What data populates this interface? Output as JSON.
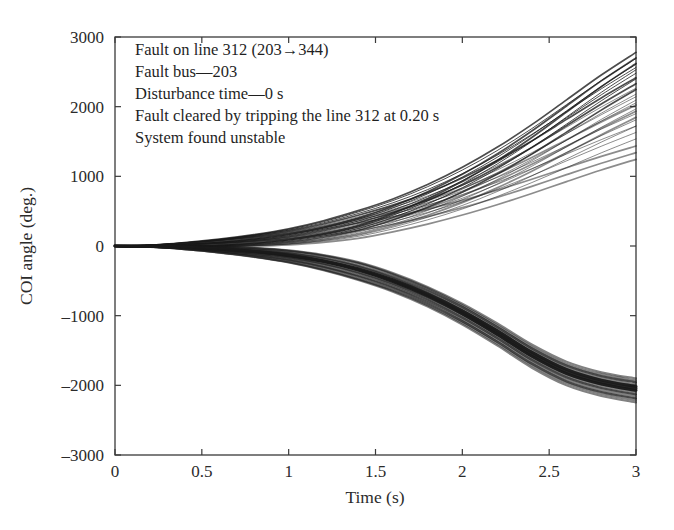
{
  "figure": {
    "background_color": "#ffffff",
    "frame_color": "#3a3a3a",
    "curve_color": "#1a1a1a"
  },
  "annotation": {
    "lines": [
      "Fault on line 312 (203→344)",
      "Fault bus—203",
      "Disturbance time—0 s",
      "Fault cleared by tripping the line 312 at 0.20 s",
      "System found unstable"
    ]
  },
  "axes": {
    "x_title": "Time (s)",
    "y_title": "COI angle (deg.)",
    "x_ticks": [
      "0",
      "0.5",
      "1",
      "1.5",
      "2",
      "2.5",
      "3"
    ],
    "y_ticks": [
      "3000",
      "2000",
      "1000",
      "0",
      "–1000",
      "–2000",
      "–3000"
    ]
  },
  "chart_data": {
    "type": "line",
    "title": "",
    "subtitle": "",
    "xlabel": "Time (s)",
    "ylabel": "COI angle (deg.)",
    "xlim": [
      0,
      3
    ],
    "ylim": [
      -3000,
      3000
    ],
    "xticks": [
      0,
      0.5,
      1,
      1.5,
      2,
      2.5,
      3
    ],
    "yticks": [
      -3000,
      -2000,
      -1000,
      0,
      1000,
      2000,
      3000
    ],
    "grid": false,
    "legend": "none",
    "annotations": [
      "Fault on line 312 (203→344)",
      "Fault bus—203",
      "Disturbance time—0 s",
      "Fault cleared by tripping the line 312 at 0.20 s",
      "System found unstable"
    ],
    "x": [
      0,
      0.2,
      0.4,
      0.6,
      0.8,
      1.0,
      1.2,
      1.4,
      1.6,
      1.8,
      2.0,
      2.2,
      2.4,
      2.6,
      2.8,
      3.0
    ],
    "series": [
      {
        "name": "gen-up-1",
        "values": [
          0,
          8,
          26,
          58,
          105,
          170,
          268,
          400,
          570,
          780,
          1030,
          1320,
          1650,
          2010,
          2370,
          2700
        ]
      },
      {
        "name": "gen-up-2",
        "values": [
          0,
          7,
          24,
          54,
          99,
          161,
          254,
          381,
          546,
          748,
          990,
          1272,
          1592,
          1940,
          2290,
          2610
        ]
      },
      {
        "name": "gen-up-3",
        "values": [
          0,
          7,
          22,
          50,
          92,
          150,
          238,
          358,
          514,
          706,
          936,
          1204,
          1508,
          1840,
          2170,
          2480
        ]
      },
      {
        "name": "gen-up-4",
        "values": [
          0,
          6,
          20,
          46,
          85,
          139,
          221,
          333,
          480,
          660,
          876,
          1128,
          1414,
          1726,
          2038,
          2330
        ]
      },
      {
        "name": "gen-up-5",
        "values": [
          0,
          6,
          19,
          43,
          79,
          129,
          205,
          310,
          446,
          614,
          816,
          1052,
          1320,
          1612,
          1906,
          2180
        ]
      },
      {
        "name": "gen-up-6",
        "values": [
          0,
          6,
          18,
          41,
          75,
          122,
          194,
          292,
          420,
          578,
          768,
          990,
          1242,
          1518,
          1794,
          2055
        ]
      },
      {
        "name": "gen-up-7",
        "values": [
          0,
          5,
          17,
          39,
          71,
          116,
          184,
          277,
          398,
          547,
          726,
          935,
          1172,
          1430,
          1690,
          1935
        ]
      },
      {
        "name": "gen-up-8",
        "values": [
          0,
          5,
          16,
          37,
          68,
          110,
          175,
          263,
          378,
          518,
          686,
          882,
          1104,
          1344,
          1584,
          1810
        ]
      },
      {
        "name": "gen-up-9",
        "values": [
          0,
          5,
          16,
          35,
          64,
          104,
          165,
          247,
          353,
          482,
          635,
          812,
          1010,
          1222,
          1432,
          1630
        ]
      },
      {
        "name": "gen-up-10",
        "values": [
          0,
          4,
          14,
          32,
          58,
          94,
          148,
          220,
          312,
          422,
          550,
          696,
          856,
          1024,
          1188,
          1340
        ]
      },
      {
        "name": "gen-down-1",
        "values": [
          0,
          -7,
          -23,
          -52,
          -95,
          -155,
          -245,
          -370,
          -535,
          -745,
          -1000,
          -1295,
          -1610,
          -1860,
          -2010,
          -2100
        ]
      },
      {
        "name": "gen-down-2",
        "values": [
          0,
          -7,
          -22,
          -50,
          -92,
          -150,
          -238,
          -360,
          -522,
          -728,
          -978,
          -1268,
          -1580,
          -1830,
          -1982,
          -2072
        ]
      },
      {
        "name": "gen-down-3",
        "values": [
          0,
          -6,
          -21,
          -48,
          -89,
          -145,
          -231,
          -350,
          -509,
          -711,
          -956,
          -1241,
          -1550,
          -1800,
          -1954,
          -2044
        ]
      }
    ]
  }
}
